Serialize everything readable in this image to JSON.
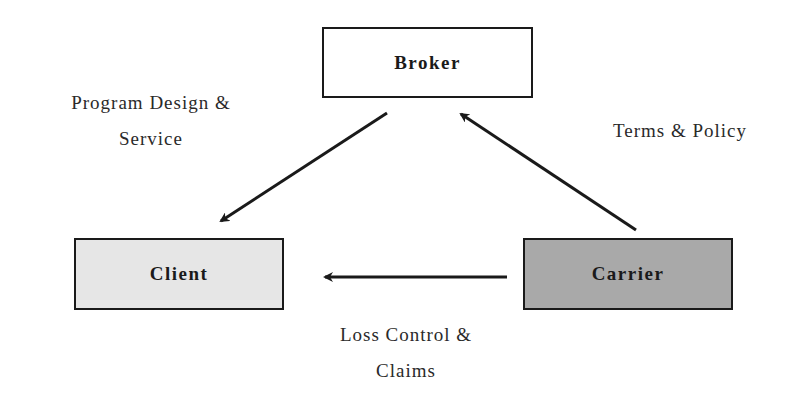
{
  "diagram": {
    "nodes": [
      {
        "id": "broker",
        "label": "Broker",
        "fill": "#ffffff"
      },
      {
        "id": "client",
        "label": "Client",
        "fill": "#e6e6e6"
      },
      {
        "id": "carrier",
        "label": "Carrier",
        "fill": "#a9a9a9"
      }
    ],
    "edges": [
      {
        "from": "broker",
        "to": "client",
        "label_lines": [
          "Program Design &",
          "Service"
        ]
      },
      {
        "from": "carrier",
        "to": "broker",
        "label_lines": [
          "Terms & Policy"
        ]
      },
      {
        "from": "carrier",
        "to": "client",
        "label_lines": [
          "Loss Control &",
          "Claims"
        ]
      }
    ],
    "colors": {
      "stroke": "#1a1a1a",
      "text": "#2a2a2a"
    }
  }
}
